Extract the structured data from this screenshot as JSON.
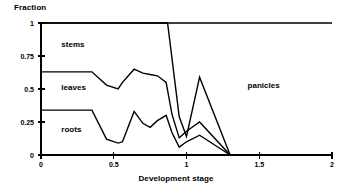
{
  "chart_data": {
    "type": "area",
    "title": "",
    "xlabel": "Development stage",
    "ylabel": "Fraction",
    "xlim": [
      0,
      2
    ],
    "ylim": [
      0,
      1
    ],
    "xticks": [
      0,
      0.5,
      1,
      1.5,
      2
    ],
    "xticklabels": [
      "0",
      "0.5",
      "1",
      "1.5",
      "2"
    ],
    "yticks": [
      0,
      0.25,
      0.5,
      0.75,
      1
    ],
    "yticklabels": [
      "0",
      "0.25",
      "0.5",
      "0.75",
      "1"
    ],
    "grid": false,
    "legend": "inline-annotations",
    "annotations": [
      {
        "text": "stems",
        "x": 0.14,
        "y": 0.83
      },
      {
        "text": "leaves",
        "x": 0.14,
        "y": 0.51
      },
      {
        "text": "roots",
        "x": 0.14,
        "y": 0.19
      },
      {
        "text": "panicles",
        "x": 1.42,
        "y": 0.52
      }
    ],
    "boundaries": [
      {
        "name": "roots-upper-boundary",
        "comment": "cumulative fraction: roots",
        "x": [
          0.0,
          0.35,
          0.45,
          0.53,
          0.56,
          0.64,
          0.7,
          0.75,
          0.8,
          0.86,
          0.9,
          0.95,
          1.0,
          1.09,
          1.3
        ],
        "y": [
          0.34,
          0.34,
          0.12,
          0.09,
          0.1,
          0.33,
          0.24,
          0.21,
          0.26,
          0.3,
          0.17,
          0.06,
          0.1,
          0.15,
          0.0
        ]
      },
      {
        "name": "leaves-upper-boundary",
        "comment": "cumulative fraction: roots + leaves",
        "x": [
          0.0,
          0.35,
          0.45,
          0.53,
          0.56,
          0.64,
          0.7,
          0.75,
          0.8,
          0.86,
          0.9,
          0.95,
          1.0,
          1.09,
          1.3
        ],
        "y": [
          0.63,
          0.63,
          0.53,
          0.5,
          0.55,
          0.65,
          0.62,
          0.61,
          0.6,
          0.55,
          0.31,
          0.13,
          0.18,
          0.25,
          0.0
        ]
      },
      {
        "name": "stems-upper-boundary",
        "comment": "cumulative fraction: roots + leaves + stems",
        "x": [
          0.0,
          0.87,
          0.95,
          1.0,
          1.09,
          1.3
        ],
        "y": [
          1.0,
          1.0,
          0.29,
          0.14,
          0.59,
          0.0
        ]
      },
      {
        "name": "total-top-line",
        "comment": "total fraction = 1 across whole axis",
        "x": [
          0.0,
          2.0
        ],
        "y": [
          1.0,
          1.0
        ]
      }
    ],
    "series": [
      {
        "name": "roots",
        "label": "roots"
      },
      {
        "name": "leaves",
        "label": "leaves"
      },
      {
        "name": "stems",
        "label": "stems"
      },
      {
        "name": "panicles",
        "label": "panicles"
      }
    ],
    "colors": {
      "line": "#000000",
      "background": "#ffffff",
      "text": "#000000"
    }
  }
}
